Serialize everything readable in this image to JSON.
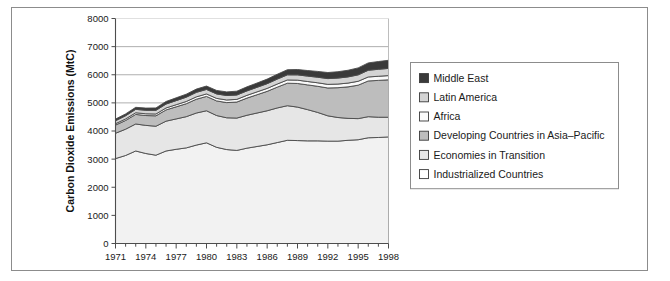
{
  "chart_data": {
    "type": "area",
    "stacked": true,
    "title": "",
    "xlabel": "",
    "ylabel": "Carbon Dioxide Emissions (MtC)",
    "xlim": [
      1971,
      1998
    ],
    "ylim": [
      0,
      8000
    ],
    "yticks": [
      0,
      1000,
      2000,
      3000,
      4000,
      5000,
      6000,
      7000,
      8000
    ],
    "ytick_labels": [
      "0",
      "1000",
      "2000",
      "3000",
      "4000",
      "5000",
      "6000",
      "7000",
      "8000"
    ],
    "xticks": [
      1971,
      1972,
      1973,
      1974,
      1975,
      1976,
      1977,
      1978,
      1979,
      1980,
      1981,
      1982,
      1983,
      1984,
      1985,
      1986,
      1987,
      1988,
      1989,
      1990,
      1991,
      1992,
      1993,
      1994,
      1995,
      1996,
      1997,
      1998
    ],
    "xtick_labels_shown": [
      "1971",
      "1974",
      "1977",
      "1980",
      "1983",
      "1986",
      "1989",
      "1992",
      "1995",
      "1998"
    ],
    "grid": "horizontal-major",
    "gridlines_at": [
      5000,
      6000,
      7000
    ],
    "legend_position": "right",
    "x": [
      1971,
      1972,
      1973,
      1974,
      1975,
      1976,
      1977,
      1978,
      1979,
      1980,
      1981,
      1982,
      1983,
      1984,
      1985,
      1986,
      1987,
      1988,
      1989,
      1990,
      1991,
      1992,
      1993,
      1994,
      1995,
      1996,
      1997,
      1998
    ],
    "series": [
      {
        "name": "Industrialized Countries",
        "color": "#f2f2f2",
        "values": [
          3020,
          3130,
          3290,
          3200,
          3140,
          3290,
          3350,
          3400,
          3500,
          3580,
          3420,
          3340,
          3310,
          3390,
          3450,
          3510,
          3590,
          3670,
          3660,
          3650,
          3650,
          3640,
          3640,
          3670,
          3690,
          3760,
          3770,
          3790
        ]
      },
      {
        "name": "Economies in Transition",
        "color": "#e6e6e6",
        "values": [
          900,
          935,
          960,
          1000,
          1030,
          1060,
          1080,
          1110,
          1140,
          1140,
          1130,
          1130,
          1150,
          1170,
          1190,
          1210,
          1230,
          1230,
          1190,
          1110,
          1010,
          900,
          840,
          780,
          750,
          750,
          720,
          700
        ]
      },
      {
        "name": "Developing Countries in Asia-Pacific",
        "color": "#bdbdbd",
        "values": [
          290,
          310,
          340,
          350,
          370,
          400,
          430,
          460,
          490,
          510,
          520,
          540,
          570,
          610,
          650,
          690,
          740,
          800,
          840,
          880,
          930,
          990,
          1060,
          1120,
          1190,
          1270,
          1310,
          1330
        ]
      },
      {
        "name": "Africa",
        "color": "#fafafa",
        "values": [
          50,
          55,
          60,
          62,
          65,
          70,
          75,
          80,
          85,
          88,
          90,
          93,
          95,
          98,
          102,
          105,
          110,
          115,
          118,
          120,
          124,
          128,
          130,
          134,
          138,
          142,
          146,
          150
        ]
      },
      {
        "name": "Latin America",
        "color": "#d4d4d4",
        "values": [
          105,
          112,
          120,
          125,
          130,
          138,
          145,
          152,
          160,
          160,
          158,
          158,
          155,
          158,
          162,
          168,
          175,
          182,
          188,
          192,
          198,
          205,
          212,
          220,
          228,
          238,
          248,
          256
        ]
      },
      {
        "name": "Middle East",
        "color": "#3a3a3a",
        "values": [
          60,
          66,
          72,
          78,
          85,
          92,
          100,
          108,
          116,
          120,
          124,
          130,
          136,
          144,
          152,
          162,
          172,
          182,
          190,
          198,
          206,
          216,
          226,
          236,
          248,
          262,
          276,
          288
        ]
      }
    ],
    "totals": [
      4425,
      4608,
      4842,
      4815,
      4820,
      5050,
      5180,
      5310,
      5491,
      5598,
      5442,
      5391,
      5416,
      5570,
      5706,
      5846,
      6017,
      6179,
      6186,
      6150,
      6118,
      6079,
      6108,
      6160,
      6244,
      6422,
      6470,
      6514
    ]
  },
  "legend": {
    "items": [
      {
        "label": "Middle East",
        "swatch": "#3a3a3a"
      },
      {
        "label": "Latin America",
        "swatch": "#d4d4d4"
      },
      {
        "label": "Africa",
        "swatch": "#fafafa"
      },
      {
        "label": "Developing Countries in Asia–Pacific",
        "swatch": "#bdbdbd"
      },
      {
        "label": "Economies in Transition",
        "swatch": "#e6e6e6"
      },
      {
        "label": "Industrialized Countries",
        "swatch": "#ffffff"
      }
    ]
  },
  "colors": {
    "frame": "#8c8c8c",
    "axis": "#4d4d4d",
    "grid": "#9a9a9a",
    "text": "#1a1a1a",
    "plot_bg": "#ffffff"
  }
}
